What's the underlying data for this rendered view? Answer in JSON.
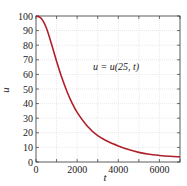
{
  "chart_data": {
    "type": "line",
    "title": "",
    "xlabel": "t",
    "ylabel": "u",
    "xlim": [
      0,
      7000
    ],
    "ylim": [
      0,
      100
    ],
    "xticks": [
      0,
      2000,
      4000,
      6000
    ],
    "xticks_minor": [
      1000,
      3000,
      5000,
      7000
    ],
    "yticks": [
      0,
      10,
      20,
      30,
      40,
      50,
      60,
      70,
      80,
      90,
      100
    ],
    "grid": true,
    "annotation": "u = u(25, t)",
    "series": [
      {
        "name": "u = u(25, t)",
        "color": "#b0202a",
        "x": [
          0,
          250,
          500,
          750,
          1000,
          1250,
          1500,
          1750,
          2000,
          2500,
          3000,
          3500,
          4000,
          4500,
          5000,
          5500,
          6000,
          6500,
          7000
        ],
        "y": [
          100,
          98.5,
          92,
          81,
          69,
          58,
          48.5,
          40.5,
          34,
          24.5,
          18,
          14,
          11,
          8.5,
          6.6,
          5.3,
          4.5,
          3.9,
          3.5
        ]
      }
    ]
  },
  "labels": {
    "xlabel": "t",
    "ylabel": "u",
    "annotation": "u = u(25, t)",
    "xtick_labels": [
      "0",
      "2000",
      "4000",
      "6000"
    ],
    "ytick_labels": [
      "0",
      "10",
      "20",
      "30",
      "40",
      "50",
      "60",
      "70",
      "80",
      "90",
      "100"
    ]
  }
}
